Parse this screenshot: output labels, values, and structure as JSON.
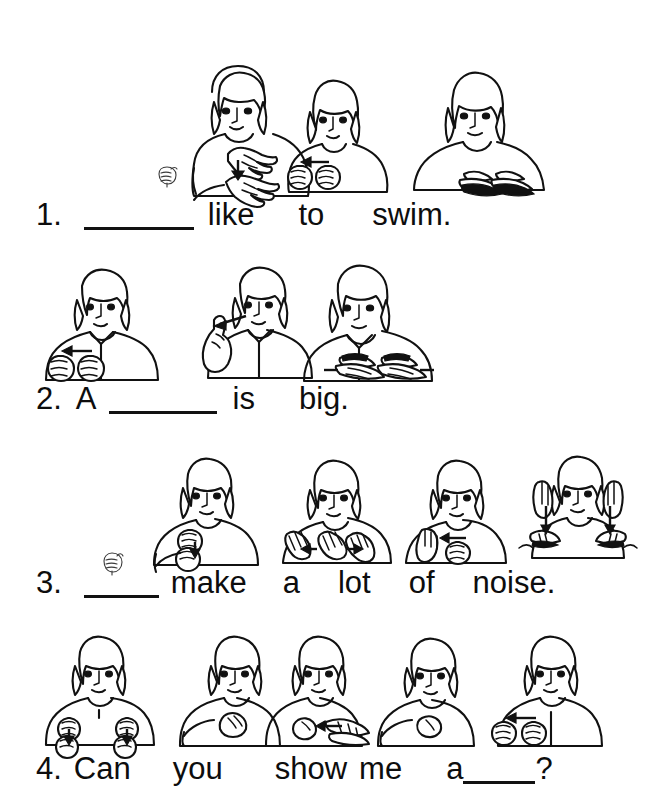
{
  "document": {
    "type": "asl-worksheet",
    "title": "Sign Language Fill-in-the-Blank Worksheet",
    "background_color": "#ffffff",
    "ink_color": "#111111"
  },
  "exercises": [
    {
      "number": "1.",
      "words": [
        "like",
        "to",
        "swim."
      ],
      "blank_positions": [
        0
      ],
      "signs": [
        {
          "name": "sign-we",
          "gloss": "WE",
          "figure": "woman",
          "hands": "both-index-chest",
          "arrow": "down"
        },
        {
          "name": "sign-like",
          "gloss": "LIKE",
          "figure": "woman",
          "hands": "both-fists-close",
          "arrow": "left"
        },
        {
          "name": "sign-swim",
          "gloss": "SWIM",
          "figure": "woman",
          "hands": "both-flat-forward",
          "arrow": "out"
        }
      ],
      "handshape_marker": "A-handshape-fist"
    },
    {
      "number": "2.",
      "words": [
        "A",
        "is",
        "big."
      ],
      "blank_positions": [
        1
      ],
      "signs": [
        {
          "name": "sign-a",
          "gloss": "A",
          "figure": "man",
          "hands": "both-fists",
          "arrow": "left"
        },
        {
          "name": "sign-is",
          "gloss": "IS",
          "figure": "man",
          "hands": "index-at-chin",
          "arrow": "left"
        },
        {
          "name": "sign-big",
          "gloss": "BIG",
          "figure": "man",
          "hands": "both-flat-spread",
          "arrow": "out"
        }
      ],
      "handshape_marker": null
    },
    {
      "number": "3.",
      "words": [
        "make",
        "a",
        "lot",
        "of",
        "noise."
      ],
      "blank_positions": [
        0
      ],
      "signs": [
        {
          "name": "sign-they",
          "gloss": "THEY",
          "figure": "woman",
          "hands": "both-fists-chest",
          "arrow": "down"
        },
        {
          "name": "sign-make",
          "gloss": "MAKE",
          "figure": "woman",
          "hands": "both-open-twist",
          "arrow": "left"
        },
        {
          "name": "sign-a-lot",
          "gloss": "A LOT",
          "figure": "woman",
          "hands": "open-palm-and-fist",
          "arrow": "left"
        },
        {
          "name": "sign-noise",
          "gloss": "NOISE",
          "figure": "woman",
          "hands": "both-hands-at-ears",
          "arrow": "down-both"
        }
      ],
      "handshape_marker": "A-handshape-fist"
    },
    {
      "number": "4.",
      "words": [
        "Can",
        "you",
        "show",
        "me",
        "a",
        "?"
      ],
      "blank_positions": [
        5
      ],
      "signs": [
        {
          "name": "sign-can",
          "gloss": "CAN",
          "figure": "woman",
          "hands": "both-fists-down",
          "arrow": "down-both"
        },
        {
          "name": "sign-you",
          "gloss": "YOU",
          "figure": "woman",
          "hands": "index-point-forward",
          "arrow": "none"
        },
        {
          "name": "sign-show",
          "gloss": "SHOW",
          "figure": "woman",
          "hands": "index-on-palm",
          "arrow": "left"
        },
        {
          "name": "sign-me",
          "gloss": "ME",
          "figure": "woman",
          "hands": "index-to-self",
          "arrow": "none"
        },
        {
          "name": "sign-a",
          "gloss": "A",
          "figure": "woman",
          "hands": "both-fists",
          "arrow": "left"
        }
      ],
      "handshape_marker": null
    }
  ]
}
